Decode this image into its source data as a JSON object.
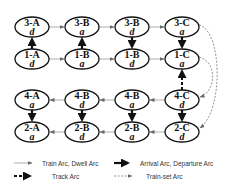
{
  "nodes": [
    {
      "id": "3A",
      "label": "3-A",
      "sub": "d",
      "cx": 32,
      "cy": 27
    },
    {
      "id": "3B1",
      "label": "3-B",
      "sub": "a",
      "cx": 82,
      "cy": 27
    },
    {
      "id": "3B2",
      "label": "3-B",
      "sub": "d",
      "cx": 132,
      "cy": 27
    },
    {
      "id": "3C",
      "label": "3-C",
      "sub": "a",
      "cx": 182,
      "cy": 27
    },
    {
      "id": "1A",
      "label": "1-A",
      "sub": "d",
      "cx": 32,
      "cy": 59
    },
    {
      "id": "1B1",
      "label": "1-B",
      "sub": "a",
      "cx": 82,
      "cy": 59
    },
    {
      "id": "1B2",
      "label": "1-B",
      "sub": "d",
      "cx": 132,
      "cy": 59
    },
    {
      "id": "1C",
      "label": "1-C",
      "sub": "a",
      "cx": 182,
      "cy": 59
    },
    {
      "id": "4A",
      "label": "4-A",
      "sub": "a",
      "cx": 32,
      "cy": 100
    },
    {
      "id": "4B1",
      "label": "4-B",
      "sub": "d",
      "cx": 82,
      "cy": 100
    },
    {
      "id": "4B2",
      "label": "4-B",
      "sub": "a",
      "cx": 132,
      "cy": 100
    },
    {
      "id": "4C",
      "label": "4-C",
      "sub": "d",
      "cx": 182,
      "cy": 100
    },
    {
      "id": "2A",
      "label": "2-A",
      "sub": "a",
      "cx": 32,
      "cy": 132
    },
    {
      "id": "2B1",
      "label": "2-B",
      "sub": "d",
      "cx": 82,
      "cy": 132
    },
    {
      "id": "2B2",
      "label": "2-B",
      "sub": "a",
      "cx": 132,
      "cy": 132
    },
    {
      "id": "2C",
      "label": "2-C",
      "sub": "d",
      "cx": 182,
      "cy": 132
    }
  ],
  "legend": {
    "train_dwell": "Train Arc, Dwell Arc",
    "arrival_departure": "Arrival Arc, Departure Arc",
    "track": "Track Arc",
    "train_set": "Train-set Arc"
  },
  "colors": {
    "stroke": "#111111",
    "thin_arc": "#888888",
    "legend_text": "#333333"
  }
}
